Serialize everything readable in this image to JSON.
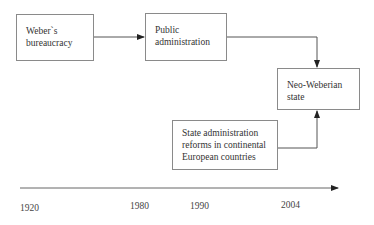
{
  "diagram": {
    "nodes": [
      {
        "id": "weber",
        "lines": [
          "Weber`s",
          "bureaucracy"
        ]
      },
      {
        "id": "public",
        "lines": [
          "Public",
          "administration"
        ]
      },
      {
        "id": "neo",
        "lines": [
          "Neo-Weberian",
          "state"
        ]
      },
      {
        "id": "reforms",
        "lines": [
          "State administration",
          "reforms in continental",
          "European countries"
        ]
      }
    ],
    "edges": [
      {
        "from": "weber",
        "to": "public"
      },
      {
        "from": "public",
        "to": "neo"
      },
      {
        "from": "reforms",
        "to": "neo"
      }
    ],
    "timeline": {
      "years": [
        "1920",
        "1980",
        "1990",
        "2004"
      ]
    },
    "colors": {
      "line": "#555555",
      "border": "#8a8a8a",
      "text": "#333333"
    }
  }
}
